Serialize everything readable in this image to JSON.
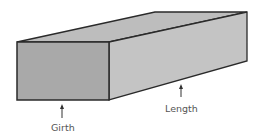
{
  "diagram": {
    "labels": {
      "girth": "Girth",
      "length": "Length"
    },
    "colors": {
      "front_face": "#a9a9a9",
      "top_face": "#bdbdbd",
      "side_face": "#c4c4c4",
      "edge": "#2a2a2a",
      "label": "#555555"
    }
  }
}
